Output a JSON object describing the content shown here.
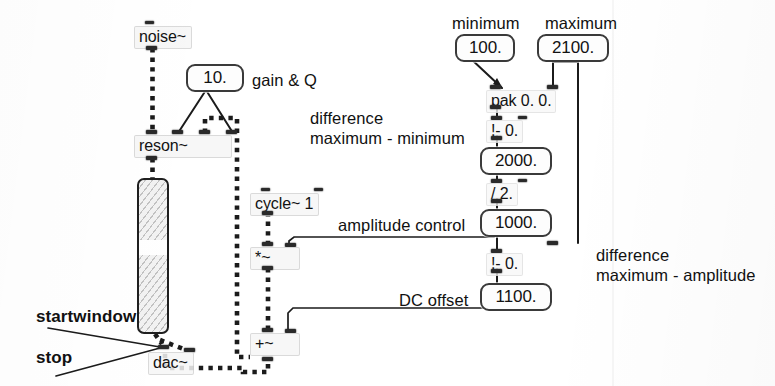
{
  "patch": {
    "title": "Max/MSP patch - noise~ / reson~ bandpass sweep",
    "objects": {
      "noise": "noise~",
      "reson": "reson~",
      "gain_q_number": "10.",
      "cycle": "cycle~ 1",
      "mult_tilde": "*~",
      "plus_tilde": "+~",
      "dac": "dac~",
      "minimum_number": "100.",
      "maximum_number": "2100.",
      "pak": "pak 0. 0.",
      "sub_inv_1": "!- 0.",
      "difference_number": "2000.",
      "divide": "/ 2.",
      "amplitude_number": "1000.",
      "sub_inv_2": "!- 0.",
      "offset_number": "1100."
    },
    "comments": {
      "gain_and_q": "gain & Q",
      "minimum": "minimum",
      "maximum": "maximum",
      "difference_max_min_line1": "difference",
      "difference_max_min_line2": "maximum - minimum",
      "amplitude_control": "amplitude control",
      "dc_offset": "DC offset",
      "difference_max_amp_line1": "difference",
      "difference_max_amp_line2": "maximum - amplitude",
      "startwindow": "startwindow",
      "stop": "stop"
    },
    "colors": {
      "ink": "#121212",
      "paper": "#ffffff",
      "numbox_border": "#3a3a3a",
      "signal_cord": "#1b1b1b",
      "control_cord": "#1b1b1b"
    }
  }
}
